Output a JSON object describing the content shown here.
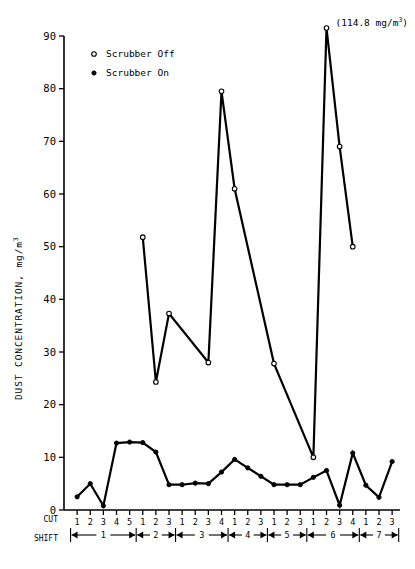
{
  "chart_data": {
    "type": "line",
    "title": "",
    "xlabel": "CUT / SHIFT",
    "ylabel": "DUST CONCENTRATION, mg/m",
    "ylabel_sup": "3",
    "ylim": [
      0,
      90
    ],
    "yticks": [
      0,
      10,
      20,
      30,
      40,
      50,
      60,
      70,
      80,
      90
    ],
    "grid": false,
    "legend_position": "top-left",
    "x": [
      1,
      2,
      3,
      4,
      5,
      6,
      7,
      8,
      9,
      10,
      11,
      12,
      13,
      14,
      15,
      16,
      17,
      18,
      19,
      20,
      21,
      22,
      23,
      24,
      25
    ],
    "cut_labels": [
      "1",
      "2",
      "3",
      "4",
      "5",
      "1",
      "2",
      "3",
      "1",
      "2",
      "3",
      "4",
      "1",
      "2",
      "3",
      "1",
      "2",
      "3",
      "1",
      "2",
      "3",
      "4",
      "1",
      "2",
      "3"
    ],
    "shifts": [
      {
        "label": "1",
        "cuts": 5
      },
      {
        "label": "2",
        "cuts": 3
      },
      {
        "label": "3",
        "cuts": 4
      },
      {
        "label": "4",
        "cuts": 3
      },
      {
        "label": "5",
        "cuts": 3
      },
      {
        "label": "6",
        "cuts": 4
      },
      {
        "label": "7",
        "cuts": 3
      }
    ],
    "series": [
      {
        "name": "Scrubber Off",
        "marker": "open-circle",
        "x": [
          6,
          7,
          8,
          11,
          12,
          13,
          16,
          19,
          20,
          21,
          22
        ],
        "values": [
          51.8,
          24.3,
          37.3,
          28.0,
          79.5,
          61.0,
          27.8,
          10.0,
          91.5,
          69.0,
          50.0
        ]
      },
      {
        "name": "Scrubber On",
        "marker": "filled-circle",
        "x": [
          1,
          2,
          3,
          4,
          5,
          6,
          7,
          8,
          9,
          10,
          11,
          12,
          13,
          14,
          15,
          16,
          17,
          18,
          19,
          20,
          21,
          22,
          23,
          24,
          25
        ],
        "values": [
          2.5,
          5.0,
          0.8,
          12.7,
          12.9,
          12.8,
          11.0,
          4.8,
          4.8,
          5.1,
          5.0,
          7.2,
          9.6,
          8.0,
          6.4,
          4.8,
          4.8,
          4.8,
          6.2,
          7.5,
          0.9,
          10.8,
          4.7,
          2.4,
          9.2
        ]
      }
    ],
    "annotations": [
      {
        "text": "(114.8 mg/m",
        "sup": "3",
        "suffix": ")",
        "at_x": 20,
        "at_y": 91.5
      }
    ]
  },
  "legend": {
    "items": [
      {
        "marker": "open-circle",
        "label": "Scrubber Off"
      },
      {
        "marker": "filled-circle",
        "label": "Scrubber On"
      }
    ]
  },
  "axis_row_labels": {
    "cut": "CUT",
    "shift": "SHIFT"
  }
}
